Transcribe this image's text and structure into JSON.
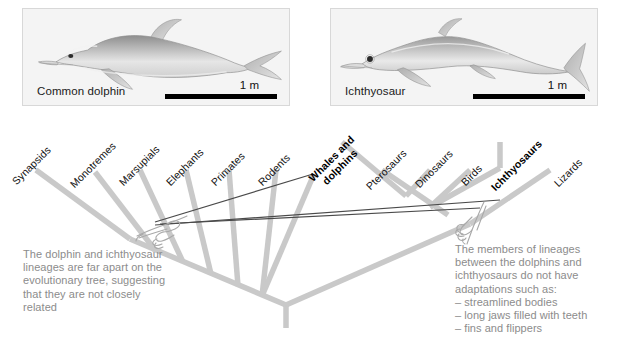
{
  "figure": {
    "panels": [
      {
        "name": "dolphin",
        "caption": "Common dolphin",
        "scale_label": "1 m"
      },
      {
        "name": "ichthyosaur",
        "caption": "Ichthyosaur",
        "scale_label": "1 m"
      }
    ]
  },
  "tree": {
    "taxa": [
      {
        "label": "Synapsids",
        "bold": false
      },
      {
        "label": "Monotremes",
        "bold": false
      },
      {
        "label": "Marsupials",
        "bold": false
      },
      {
        "label": "Elephants",
        "bold": false
      },
      {
        "label": "Primates",
        "bold": false
      },
      {
        "label": "Rodents",
        "bold": false
      },
      {
        "label": "Whales and dolphins",
        "bold": true
      },
      {
        "label": "Pterosaurs",
        "bold": false
      },
      {
        "label": "Dinosaurs",
        "bold": false
      },
      {
        "label": "Birds",
        "bold": false
      },
      {
        "label": "Ichthyosaurs",
        "bold": true
      },
      {
        "label": "Lizards",
        "bold": false
      }
    ],
    "branch_color": "#c9c9c9",
    "connector_color": "#4a4a4a"
  },
  "notes": {
    "left": {
      "lines": [
        "The dolphin and ichthyosaur",
        "lineages are far apart on the",
        "evolutionary tree, suggesting",
        "that they are not closely",
        "related"
      ]
    },
    "right": {
      "lines": [
        "The members of lineages",
        "between the dolphins and",
        "ichthyosaurs do not have",
        "adaptations such as:",
        "– streamlined bodies",
        "– long jaws filled with teeth",
        "– fins and flippers"
      ]
    }
  },
  "colors": {
    "background": "#ffffff",
    "panel_fill": "#f4f4f4",
    "panel_border": "#d8d8d8",
    "note_text": "#8c8c8c",
    "scale_bar": "#000000"
  }
}
